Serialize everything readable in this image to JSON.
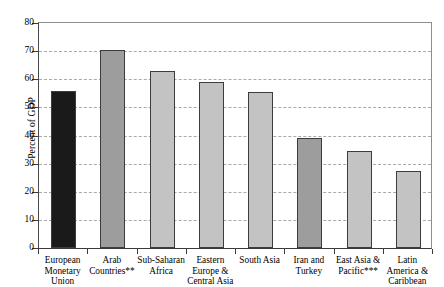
{
  "chart_data": {
    "type": "bar",
    "title": "",
    "xlabel": "",
    "ylabel": "Percent of GDP",
    "ylim": [
      0,
      80
    ],
    "ytick_step": 10,
    "yticks": [
      "0",
      "10",
      "20",
      "30",
      "40",
      "50",
      "60",
      "70",
      "80"
    ],
    "grid": true,
    "legend": "none",
    "categories": [
      "European\nMonetary\nUnion",
      "Arab\nCountries**",
      "Sub-Saharan\nAfrica",
      "Eastern\nEurope &\nCentral Asia",
      "South Asia",
      "Iran and\nTurkey",
      "East Asia &\nPacific***",
      "Latin\nAmerica &\nCaribbean"
    ],
    "values": [
      56,
      70.5,
      63,
      59,
      55.5,
      39,
      34.5,
      27.5
    ],
    "bar_colors": [
      "#1a1a1a",
      "#9d9d9d",
      "#c3c3c3",
      "#c3c3c3",
      "#c3c3c3",
      "#9d9d9d",
      "#c3c3c3",
      "#c3c3c3"
    ],
    "bar_border_color": "#3c3c3c",
    "gridline_color": "#a9a9a9",
    "axis_color": "#3a3a3a"
  }
}
